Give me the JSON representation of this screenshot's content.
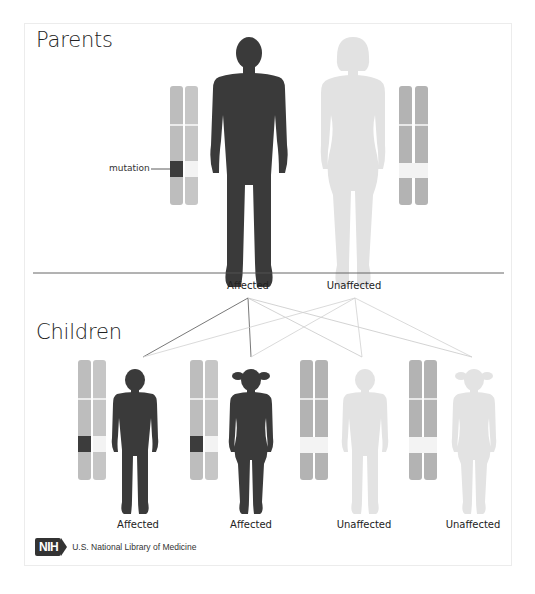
{
  "sections": {
    "parents_heading": "Parents",
    "children_heading": "Children"
  },
  "annotation": {
    "mutation_label": "mutation"
  },
  "parents": [
    {
      "id": "father",
      "label": "Affected",
      "status": "affected",
      "color": "#3a3a3a"
    },
    {
      "id": "mother",
      "label": "Unaffected",
      "status": "unaffected",
      "color": "#e2e2e2"
    }
  ],
  "children": [
    {
      "id": "son-1",
      "label": "Affected",
      "status": "affected",
      "sex": "male"
    },
    {
      "id": "daughter-1",
      "label": "Affected",
      "status": "affected",
      "sex": "female"
    },
    {
      "id": "son-2",
      "label": "Unaffected",
      "status": "unaffected",
      "sex": "male"
    },
    {
      "id": "daughter-2",
      "label": "Unaffected",
      "status": "unaffected",
      "sex": "female"
    }
  ],
  "colors": {
    "affected_figure": "#3a3a3a",
    "unaffected_figure": "#e3e3e3",
    "chromosome_gray": "#b5b5b5",
    "chromosome_light": "#c9c9c9",
    "mutation_band": "#3c3c3c",
    "normal_band": "#f3f3f3"
  },
  "footer": {
    "logo_text": "NIH",
    "org_name": "U.S. National Library of Medicine"
  }
}
